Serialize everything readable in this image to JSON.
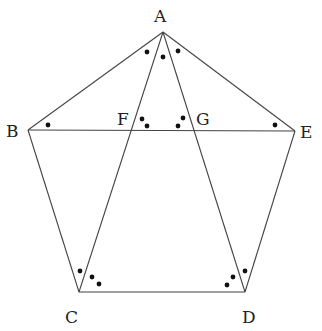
{
  "diagram": {
    "type": "regular-pentagon-with-star-diagonals",
    "stroke_color": "#444444",
    "dot_color": "#111111",
    "vertices": {
      "A": {
        "x": 163,
        "y": 32
      },
      "B": {
        "x": 28,
        "y": 130
      },
      "C": {
        "x": 79,
        "y": 292
      },
      "D": {
        "x": 245,
        "y": 292
      },
      "E": {
        "x": 295,
        "y": 131
      }
    },
    "labels": [
      {
        "id": "A",
        "text": "A",
        "x": 154,
        "y": 22
      },
      {
        "id": "B",
        "text": "B",
        "x": 6,
        "y": 137
      },
      {
        "id": "C",
        "text": "C",
        "x": 65,
        "y": 323
      },
      {
        "id": "D",
        "text": "D",
        "x": 242,
        "y": 323
      },
      {
        "id": "E",
        "text": "E",
        "x": 300,
        "y": 138
      },
      {
        "id": "F",
        "text": "F",
        "x": 117,
        "y": 125
      },
      {
        "id": "G",
        "text": "G",
        "x": 196,
        "y": 125
      }
    ],
    "segments": [
      {
        "from": "A",
        "to": "B"
      },
      {
        "from": "B",
        "to": "C"
      },
      {
        "from": "C",
        "to": "D"
      },
      {
        "from": "D",
        "to": "E"
      },
      {
        "from": "E",
        "to": "A"
      },
      {
        "from": "B",
        "to": "E"
      },
      {
        "from": "A",
        "to": "C"
      },
      {
        "from": "A",
        "to": "D"
      }
    ],
    "angle_marks": [
      {
        "at": "A",
        "dots": [
          {
            "x": 147,
            "y": 52
          },
          {
            "x": 163,
            "y": 57
          },
          {
            "x": 178,
            "y": 51
          }
        ]
      },
      {
        "at": "B",
        "dots": [
          {
            "x": 48,
            "y": 125
          }
        ]
      },
      {
        "at": "E",
        "dots": [
          {
            "x": 275,
            "y": 125
          }
        ]
      },
      {
        "at": "F",
        "dots": [
          {
            "x": 142,
            "y": 119
          },
          {
            "x": 147,
            "y": 126
          }
        ]
      },
      {
        "at": "G",
        "dots": [
          {
            "x": 183,
            "y": 118
          },
          {
            "x": 178,
            "y": 126
          }
        ]
      },
      {
        "at": "C",
        "dots": [
          {
            "x": 80,
            "y": 271
          },
          {
            "x": 92,
            "y": 277
          },
          {
            "x": 99,
            "y": 284
          }
        ]
      },
      {
        "at": "D",
        "dots": [
          {
            "x": 245,
            "y": 271
          },
          {
            "x": 233,
            "y": 277
          },
          {
            "x": 227,
            "y": 285
          }
        ]
      }
    ]
  }
}
